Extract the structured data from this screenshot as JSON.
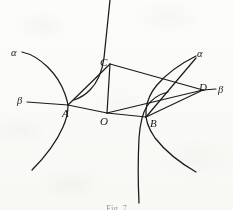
{
  "figure": {
    "caption": "Fig. 7",
    "background_color": "#fdfdfc",
    "ink_color": "#1a1a1a"
  },
  "points": [
    {
      "id": "A",
      "label": "A",
      "x": 68,
      "y": 105,
      "label_x": 62,
      "label_y": 108
    },
    {
      "id": "B",
      "label": "B",
      "x": 146,
      "y": 117,
      "label_x": 150,
      "label_y": 118
    },
    {
      "id": "C",
      "label": "C",
      "x": 110,
      "y": 64,
      "label_x": 100,
      "label_y": 60
    },
    {
      "id": "D",
      "label": "D",
      "x": 203,
      "y": 90,
      "label_x": 200,
      "label_y": 84
    },
    {
      "id": "O",
      "label": "O",
      "x": 107,
      "y": 113,
      "label_x": 100,
      "label_y": 116
    }
  ],
  "asymptote_labels": [
    {
      "id": "alpha-left",
      "label": "α",
      "x": 12,
      "y": 52
    },
    {
      "id": "alpha-right",
      "label": "α",
      "x": 198,
      "y": 53
    },
    {
      "id": "beta-left",
      "label": "β",
      "x": 18,
      "y": 100
    },
    {
      "id": "beta-right",
      "label": "β",
      "x": 219,
      "y": 89
    }
  ],
  "segments": [
    {
      "id": "segment-beta-left-to-A",
      "from": "beta-left-tip",
      "to": "A"
    },
    {
      "id": "segment-A-O",
      "from": "A",
      "to": "O"
    },
    {
      "id": "segment-A-C",
      "from": "A",
      "to": "C"
    },
    {
      "id": "segment-C-O",
      "from": "C",
      "to": "O"
    },
    {
      "id": "segment-C-D",
      "from": "C",
      "to": "D"
    },
    {
      "id": "segment-O-B",
      "from": "O",
      "to": "B"
    },
    {
      "id": "segment-O-D",
      "from": "O",
      "to": "D"
    },
    {
      "id": "segment-B-D",
      "from": "B",
      "to": "D"
    },
    {
      "id": "segment-D-beta-right",
      "from": "D",
      "to": "beta-right-tip"
    },
    {
      "id": "segment-B-alpha-right",
      "from": "B",
      "to": "alpha-right-tip"
    }
  ],
  "curves": [
    {
      "id": "hyperbola-left",
      "through": "A",
      "opens": "left",
      "description": "hyperbola branch with vertex at A opening toward the left"
    },
    {
      "id": "hyperbola-right",
      "through": "B",
      "opens": "right",
      "description": "hyperbola branch with vertex at B opening toward the right"
    },
    {
      "id": "hyperbola-upper",
      "through": "C",
      "opens": "up",
      "description": "near-vertical hyperbola branch passing through C"
    },
    {
      "id": "hyperbola-lower",
      "through": "B",
      "opens": "down",
      "description": "near-vertical hyperbola branch passing through B"
    }
  ]
}
